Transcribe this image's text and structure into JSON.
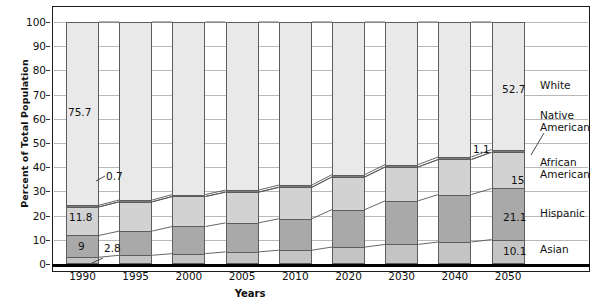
{
  "chart_data": {
    "type": "bar",
    "subtype": "stacked-100-percent",
    "title": "",
    "xlabel": "Years",
    "ylabel": "Percent of Total Population",
    "ylim": [
      0,
      100
    ],
    "yticks": [
      0,
      10,
      20,
      30,
      40,
      50,
      60,
      70,
      80,
      90,
      100
    ],
    "grid": true,
    "legend_position": "right",
    "categories": [
      "1990",
      "1995",
      "2000",
      "2005",
      "2010",
      "2020",
      "2030",
      "2040",
      "2050"
    ],
    "series": [
      {
        "name": "Asian",
        "color": "#c4c4c4",
        "values": [
          2.8,
          3.6,
          4.3,
          5.0,
          5.7,
          7.0,
          8.1,
          9.1,
          10.1
        ]
      },
      {
        "name": "Hispanic",
        "color": "#a9a9a9",
        "values": [
          9.0,
          10.0,
          11.2,
          12.0,
          13.0,
          15.5,
          18.0,
          19.6,
          21.1
        ]
      },
      {
        "name": "African American",
        "color": "#d2d2d2",
        "values": [
          11.8,
          12.1,
          12.4,
          12.7,
          13.0,
          13.5,
          14.0,
          14.5,
          15.0
        ]
      },
      {
        "name": "Native American",
        "color": "#7a7a7a",
        "values": [
          0.7,
          0.75,
          0.8,
          0.85,
          0.9,
          0.95,
          1.0,
          1.05,
          1.1
        ]
      },
      {
        "name": "White",
        "color": "#e9e9e9",
        "values": [
          75.7,
          73.55,
          71.3,
          69.45,
          67.4,
          63.05,
          58.9,
          55.75,
          52.7
        ]
      }
    ],
    "value_labels": [
      {
        "text": "75.7",
        "series": "White",
        "category": "1990"
      },
      {
        "text": "0.7",
        "series": "Native American",
        "category": "1990"
      },
      {
        "text": "11.8",
        "series": "African American",
        "category": "1990"
      },
      {
        "text": "9",
        "series": "Hispanic",
        "category": "1990"
      },
      {
        "text": "2.8",
        "series": "Asian",
        "category": "1990"
      },
      {
        "text": "52.7",
        "series": "White",
        "category": "2050"
      },
      {
        "text": "1.1",
        "series": "Native American",
        "category": "2050"
      },
      {
        "text": "15",
        "series": "African American",
        "category": "2050"
      },
      {
        "text": "21.1",
        "series": "Hispanic",
        "category": "2050"
      },
      {
        "text": "10.1",
        "series": "Asian",
        "category": "2050"
      }
    ]
  },
  "axis": {
    "ylabel": "Percent of Total Population",
    "xlabel": "Years",
    "yticks": [
      "100",
      "90",
      "80",
      "70",
      "60",
      "50",
      "40",
      "30",
      "20",
      "10",
      "0"
    ],
    "xticks": [
      "1990",
      "1995",
      "2000",
      "2005",
      "2010",
      "2020",
      "2030",
      "2040",
      "2050"
    ]
  },
  "legend": {
    "items": [
      {
        "label": "White"
      },
      {
        "label": "Native\nAmerican"
      },
      {
        "label": "African\nAmerican"
      },
      {
        "label": "Hispanic"
      },
      {
        "label": "Asian"
      }
    ]
  },
  "labels": {
    "l_75_7": "75.7",
    "l_0_7": "0.7",
    "l_11_8": "11.8",
    "l_9": "9",
    "l_2_8": "2.8",
    "l_52_7": "52.7",
    "l_1_1": "1.1",
    "l_15": "15",
    "l_21_1": "21.1",
    "l_10_1": "10.1"
  }
}
